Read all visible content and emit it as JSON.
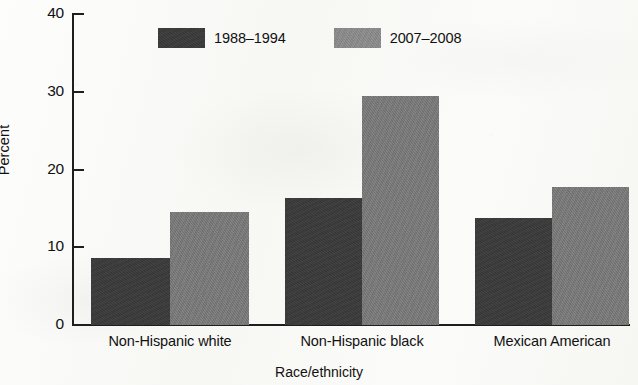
{
  "chart_data": {
    "type": "bar",
    "title": "",
    "subtitle": "",
    "xlabel": "Race/ethnicity",
    "ylabel": "Percent",
    "ylim": [
      0,
      40
    ],
    "yticks": [
      0,
      10,
      20,
      30,
      40
    ],
    "ytick_labels": [
      "0",
      "10",
      "20",
      "30",
      "40"
    ],
    "grid": false,
    "legend_position": "top-center",
    "categories": [
      "Non-Hispanic white",
      "Non-Hispanic black",
      "Mexican American"
    ],
    "series": [
      {
        "name": "1988–1994",
        "color": "#3a3a3a",
        "values": [
          8.6,
          16.4,
          13.7
        ]
      },
      {
        "name": "2007–2008",
        "color": "#787878",
        "values": [
          14.6,
          29.4,
          17.8
        ]
      }
    ],
    "annotations": []
  },
  "axes": {
    "y_title": "Percent",
    "x_title": "Race/ethnicity",
    "y_tick_0": "0",
    "y_tick_1": "10",
    "y_tick_2": "20",
    "y_tick_3": "30",
    "y_tick_4": "40"
  },
  "legend": {
    "items": [
      {
        "label": "1988–1994",
        "color": "#3a3a3a"
      },
      {
        "label": "2007–2008",
        "color": "#787878"
      }
    ]
  },
  "colors": {
    "series_1988_1994": "#3a3a3a",
    "series_2007_2008": "#787878",
    "axis": "#1e1e1e",
    "background": "#fdfdfb",
    "text": "#111111"
  }
}
